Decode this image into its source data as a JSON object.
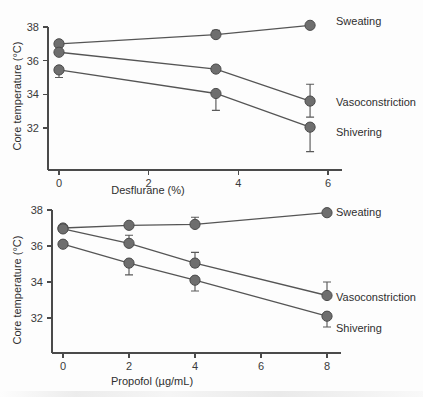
{
  "chart_data": [
    {
      "type": "line",
      "panel": "top",
      "title": "",
      "xlabel": "Desflurane (%)",
      "ylabel": "Core temperature (°C)",
      "xlim": [
        0,
        6
      ],
      "ylim": [
        30.4,
        38.6
      ],
      "xticks": [
        0,
        2,
        4,
        6
      ],
      "xticklabels": [
        "0",
        "2",
        "4",
        "6"
      ],
      "yticks": [
        32,
        34,
        36,
        38
      ],
      "yticklabels": [
        "32",
        "34",
        "36",
        "38"
      ],
      "grid": false,
      "legend_position": "right-of-axes",
      "series": [
        {
          "name": "Sweating",
          "x": [
            0,
            3.5,
            5.6
          ],
          "values": [
            37.0,
            37.55,
            38.1
          ],
          "err_up": [
            0,
            0.25,
            0
          ],
          "err_down": [
            0,
            0,
            0
          ]
        },
        {
          "name": "Vasoconstriction",
          "x": [
            0,
            3.5,
            5.6
          ],
          "values": [
            36.5,
            35.5,
            33.6
          ],
          "err_up": [
            0,
            0.18,
            1.0
          ],
          "err_down": [
            0,
            0.1,
            0.95
          ]
        },
        {
          "name": "Shivering",
          "x": [
            0,
            3.5,
            5.6
          ],
          "values": [
            35.45,
            34.05,
            32.05
          ],
          "err_up": [
            0,
            0,
            0.2
          ],
          "err_down": [
            0.45,
            1.0,
            1.45
          ]
        }
      ]
    },
    {
      "type": "line",
      "panel": "bottom",
      "title": "",
      "xlabel": "Propofol (µg/mL)",
      "ylabel": "Core temperature (°C)",
      "xlim": [
        0,
        8
      ],
      "ylim": [
        30.6,
        38.6
      ],
      "xticks": [
        0,
        2,
        4,
        6,
        8
      ],
      "xticklabels": [
        "0",
        "2",
        "4",
        "6",
        "8"
      ],
      "yticks": [
        32,
        34,
        36,
        38
      ],
      "yticklabels": [
        "32",
        "34",
        "36",
        "38"
      ],
      "grid": false,
      "legend_position": "right-of-axes",
      "series": [
        {
          "name": "Sweating",
          "x": [
            0,
            2,
            4,
            8
          ],
          "values": [
            37.0,
            37.15,
            37.2,
            37.85
          ],
          "err_up": [
            0,
            0,
            0.4,
            0
          ],
          "err_down": [
            0,
            0,
            0.1,
            0
          ]
        },
        {
          "name": "Vasoconstriction",
          "x": [
            0,
            2,
            4,
            8
          ],
          "values": [
            36.95,
            36.15,
            35.05,
            33.25
          ],
          "err_up": [
            0,
            0.45,
            0.6,
            0.75
          ],
          "err_down": [
            0,
            0.15,
            0.2,
            0.1
          ]
        },
        {
          "name": "Shivering",
          "x": [
            0,
            2,
            4,
            8
          ],
          "values": [
            36.1,
            35.05,
            34.1,
            32.1
          ],
          "err_up": [
            0,
            0,
            0,
            0
          ],
          "err_down": [
            0,
            0.65,
            0.6,
            0.6
          ]
        }
      ]
    }
  ],
  "figure": {
    "panels": [
      {
        "id": "top",
        "xlabel": "Desflurane (%)",
        "ylabel": "Core temperature (°C)",
        "xticklabels": [
          "0",
          "2",
          "4",
          "6"
        ],
        "yticklabels": [
          "32",
          "34",
          "36",
          "38"
        ],
        "series_labels": [
          "Sweating",
          "Vasoconstriction",
          "Shivering"
        ]
      },
      {
        "id": "bottom",
        "xlabel": "Propofol (µg/mL)",
        "ylabel": "Core temperature (°C)",
        "xticklabels": [
          "0",
          "2",
          "4",
          "6",
          "8"
        ],
        "yticklabels": [
          "32",
          "34",
          "36",
          "38"
        ],
        "series_labels": [
          "Sweating",
          "Vasoconstriction",
          "Shivering"
        ]
      }
    ],
    "colors": {
      "marker": "#6e6e6e",
      "marker_edge": "#4b4b4b",
      "line": "#555555",
      "axis": "#4a4a4a",
      "text": "#2f2f2f",
      "background": "#fdfdfd"
    }
  }
}
